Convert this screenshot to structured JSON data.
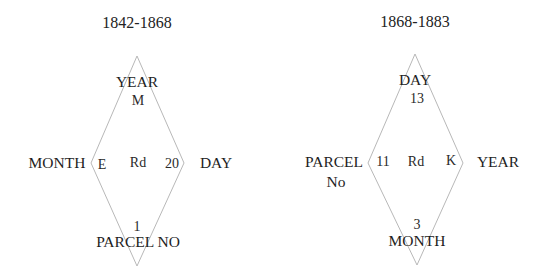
{
  "diagrams": [
    {
      "title": "1842-1868",
      "outer": {
        "top": "YEAR",
        "left": "MONTH",
        "right": "DAY",
        "bottom": "PARCEL NO"
      },
      "inner": {
        "top": "M",
        "left": "E",
        "center": "Rd",
        "right": "20",
        "bottom": "1"
      }
    },
    {
      "title": "1868-1883",
      "outer": {
        "top": "DAY",
        "left_line1": "PARCEL",
        "left_line2": "No",
        "right": "YEAR",
        "bottom": "MONTH"
      },
      "inner": {
        "top": "13",
        "left": "11",
        "center": "Rd",
        "right": "K",
        "bottom": "3"
      }
    }
  ],
  "colors": {
    "line": "#b8b8b8",
    "text": "#1e1e1e",
    "background": "#ffffff"
  }
}
